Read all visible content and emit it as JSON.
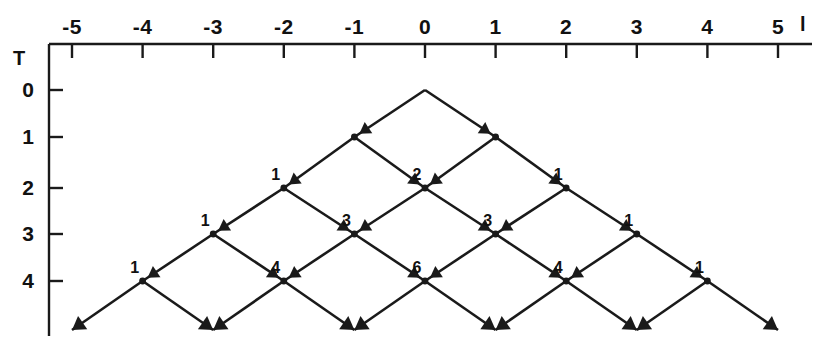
{
  "figure": {
    "kind": "binomial-lattice-random-walk",
    "background_color": "#ffffff",
    "ink_color": "#1a1a1a",
    "width": 828,
    "height": 350
  },
  "axes": {
    "x": {
      "name": "l",
      "name_pos": {
        "x": 800,
        "y": 14
      },
      "axis_y": 44,
      "axis_x_start": 49,
      "axis_x_end": 812,
      "origin_px": 425,
      "spacing_px": 70.6,
      "tick_len": 14,
      "ticks": [
        {
          "label": "-5",
          "value": -5,
          "x": 72.0
        },
        {
          "label": "-4",
          "value": -4,
          "x": 142.6
        },
        {
          "label": "-3",
          "value": -3,
          "x": 213.2
        },
        {
          "label": "-2",
          "value": -2,
          "x": 283.8
        },
        {
          "label": "-1",
          "value": -1,
          "x": 354.4
        },
        {
          "label": "0",
          "value": 0,
          "x": 425.0
        },
        {
          "label": "1",
          "value": 1,
          "x": 495.6
        },
        {
          "label": "2",
          "value": 2,
          "x": 566.2
        },
        {
          "label": "3",
          "value": 3,
          "x": 636.8
        },
        {
          "label": "4",
          "value": 4,
          "x": 707.4
        },
        {
          "label": "5",
          "value": 5,
          "x": 778.0
        }
      ]
    },
    "t": {
      "name": "T",
      "name_pos": {
        "x": 13,
        "y": 48
      },
      "axis_x": 49,
      "axis_y_start": 44,
      "axis_y_end": 336,
      "tick_len": 14,
      "ticks": [
        {
          "label": "0",
          "value": 0,
          "y": 90
        },
        {
          "label": "1",
          "value": 1,
          "y": 137
        },
        {
          "label": "2",
          "value": 2,
          "y": 188
        },
        {
          "label": "3",
          "value": 3,
          "y": 234
        },
        {
          "label": "4",
          "value": 4,
          "y": 281
        }
      ]
    }
  },
  "chart_data": {
    "type": "diagram",
    "title": "",
    "xlabel": "l",
    "ylabel": "T",
    "x_tick_labels": [
      "-5",
      "-4",
      "-3",
      "-2",
      "-1",
      "0",
      "1",
      "2",
      "3",
      "4",
      "5"
    ],
    "t_tick_labels": [
      "0",
      "1",
      "2",
      "3",
      "4"
    ],
    "rows": [
      {
        "T": 0,
        "nodes": [
          {
            "l": 0,
            "count": null
          }
        ]
      },
      {
        "T": 1,
        "nodes": [
          {
            "l": -1,
            "count": null
          },
          {
            "l": 1,
            "count": null
          }
        ]
      },
      {
        "T": 2,
        "nodes": [
          {
            "l": -2,
            "count": 1
          },
          {
            "l": 0,
            "count": 2
          },
          {
            "l": 2,
            "count": 1
          }
        ]
      },
      {
        "T": 3,
        "nodes": [
          {
            "l": -3,
            "count": 1
          },
          {
            "l": -1,
            "count": 3
          },
          {
            "l": 1,
            "count": 3
          },
          {
            "l": 3,
            "count": 1
          }
        ]
      },
      {
        "T": 4,
        "nodes": [
          {
            "l": -4,
            "count": 1
          },
          {
            "l": -2,
            "count": 4
          },
          {
            "l": 0,
            "count": 6
          },
          {
            "l": 2,
            "count": 4
          },
          {
            "l": 4,
            "count": 1
          }
        ]
      }
    ],
    "node_labels_visible": [
      "1",
      "2",
      "1",
      "1",
      "3",
      "3",
      "1",
      "1",
      "4",
      "6",
      "4",
      "1"
    ],
    "terminal_arrow_tips_l": [
      -5,
      -3,
      -1,
      1,
      3,
      5
    ],
    "terminal_arrow_T": 5
  }
}
